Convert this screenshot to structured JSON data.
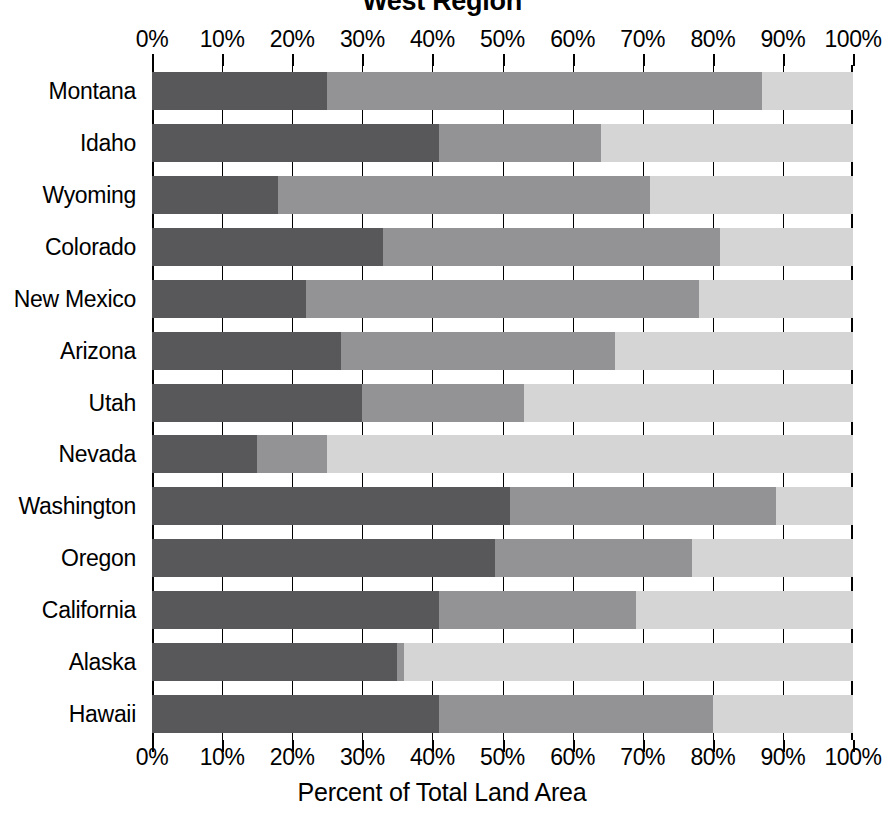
{
  "chart_data": {
    "type": "bar",
    "subtype": "horizontal-stacked-100-percent",
    "title": "West Region",
    "xlabel": "Percent of Total Land Area",
    "ylabel": "",
    "xlim": [
      0,
      100
    ],
    "xticks": [
      0,
      10,
      20,
      30,
      40,
      50,
      60,
      70,
      80,
      90,
      100
    ],
    "xtick_labels": [
      "0%",
      "10%",
      "20%",
      "30%",
      "40%",
      "50%",
      "60%",
      "70%",
      "80%",
      "90%",
      "100%"
    ],
    "grid": true,
    "legend": null,
    "axis_positions": {
      "top": true,
      "bottom": true
    },
    "categories": [
      "Montana",
      "Idaho",
      "Wyoming",
      "Colorado",
      "New Mexico",
      "Arizona",
      "Utah",
      "Nevada",
      "Washington",
      "Oregon",
      "California",
      "Alaska",
      "Hawaii"
    ],
    "series": [
      {
        "name": "segment-1",
        "color": "#58585a",
        "values": [
          25,
          41,
          18,
          33,
          22,
          27,
          30,
          15,
          51,
          49,
          41,
          35,
          41
        ]
      },
      {
        "name": "segment-2",
        "color": "#939395",
        "values": [
          62,
          23,
          53,
          48,
          56,
          39,
          23,
          10,
          38,
          28,
          28,
          1,
          39
        ]
      },
      {
        "name": "segment-3",
        "color": "#d5d5d6",
        "values": [
          13,
          36,
          29,
          19,
          22,
          34,
          47,
          75,
          11,
          23,
          31,
          64,
          20
        ]
      }
    ],
    "cumulative_boundaries": [
      [
        25,
        87
      ],
      [
        41,
        64
      ],
      [
        18,
        71
      ],
      [
        33,
        81
      ],
      [
        22,
        78
      ],
      [
        27,
        66
      ],
      [
        30,
        53
      ],
      [
        15,
        25
      ],
      [
        51,
        89
      ],
      [
        49,
        77
      ],
      [
        41,
        69
      ],
      [
        35,
        36
      ],
      [
        41,
        80
      ]
    ]
  }
}
